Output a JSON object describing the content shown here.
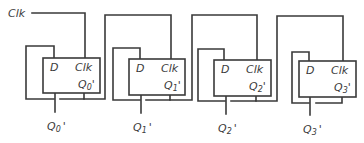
{
  "diagram": {
    "type": "ripple-counter-dff-chain",
    "clock_input_label": "Clk",
    "colors": {
      "line": "#3a3a3a",
      "background": "#ffffff"
    },
    "flip_flops": [
      {
        "d_label": "D",
        "clk_label": "Clk",
        "q_main": "Q",
        "q_sub": "0",
        "q_prime": "'",
        "out_main": "Q",
        "out_sub": "0",
        "out_prime": "'"
      },
      {
        "d_label": "D",
        "clk_label": "Clk",
        "q_main": "Q",
        "q_sub": "1",
        "q_prime": "'",
        "out_main": "Q",
        "out_sub": "1",
        "out_prime": "'"
      },
      {
        "d_label": "D",
        "clk_label": "Clk",
        "q_main": "Q",
        "q_sub": "2",
        "q_prime": "'",
        "out_main": "Q",
        "out_sub": "2",
        "out_prime": "'"
      },
      {
        "d_label": "D",
        "clk_label": "Clk",
        "q_main": "Q",
        "q_sub": "3",
        "q_prime": "'",
        "out_main": "Q",
        "out_sub": "3",
        "out_prime": "'"
      }
    ]
  }
}
